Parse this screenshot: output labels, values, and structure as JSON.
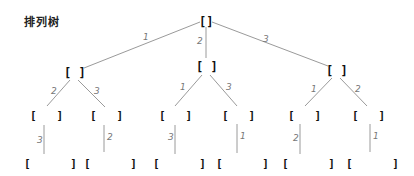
{
  "title": "排列树",
  "colors": {
    "edge": "#9a9a9a",
    "label": "#777777",
    "node": "#111111"
  },
  "tree": {
    "root": {
      "label": "[]",
      "x": 206,
      "y": 22
    },
    "level1": [
      {
        "label": "[ ]",
        "x": 74,
        "y": 73,
        "edge_label": "1"
      },
      {
        "label": "[ ]",
        "x": 206,
        "y": 67,
        "edge_label": "2"
      },
      {
        "label": "[ ]",
        "x": 336,
        "y": 71,
        "edge_label": "3"
      }
    ],
    "level2": [
      {
        "label": "[   ]",
        "x": 44,
        "y": 115,
        "edge_label": "2"
      },
      {
        "label": "[   ]",
        "x": 104,
        "y": 115,
        "edge_label": "3"
      },
      {
        "label": "[   ]",
        "x": 173,
        "y": 115,
        "edge_label": "1"
      },
      {
        "label": "[   ]",
        "x": 236,
        "y": 115,
        "edge_label": "3"
      },
      {
        "label": "[   ]",
        "x": 302,
        "y": 115,
        "edge_label": "1"
      },
      {
        "label": "[   ]",
        "x": 366,
        "y": 115,
        "edge_label": "2"
      }
    ],
    "level3": [
      {
        "label": "[      ]",
        "x": 44,
        "y": 163,
        "edge_label": "3"
      },
      {
        "label": "[      ]",
        "x": 104,
        "y": 163,
        "edge_label": "2"
      },
      {
        "label": "[      ]",
        "x": 173,
        "y": 163,
        "edge_label": "3"
      },
      {
        "label": "[      ]",
        "x": 236,
        "y": 163,
        "edge_label": "1"
      },
      {
        "label": "[      ]",
        "x": 302,
        "y": 163,
        "edge_label": "2"
      },
      {
        "label": "[      ]",
        "x": 366,
        "y": 163,
        "edge_label": "1"
      }
    ]
  }
}
